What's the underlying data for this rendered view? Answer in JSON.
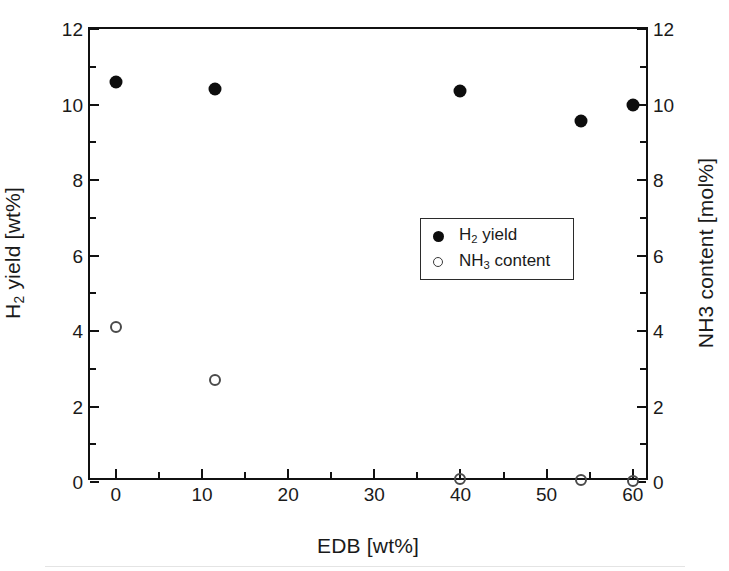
{
  "chart_data": {
    "type": "scatter",
    "title": "",
    "xlabel": "EDB [wt%]",
    "ylabel": "H2 yield [wt%]",
    "y2label": "NH3 content [mol%]",
    "xlim": [
      -3,
      62
    ],
    "ylim": [
      0,
      12
    ],
    "y2lim": [
      0,
      12
    ],
    "xticks": [
      0,
      10,
      20,
      30,
      40,
      50,
      60
    ],
    "xticklabels": [
      "0",
      "10",
      "20",
      "30",
      "40",
      "50",
      "60"
    ],
    "yticks": [
      0,
      2,
      4,
      6,
      8,
      10,
      12
    ],
    "yticklabels": [
      "0",
      "2",
      "4",
      "6",
      "8",
      "10",
      "12"
    ],
    "y2ticks": [
      0,
      2,
      4,
      6,
      8,
      10,
      12
    ],
    "y2ticklabels": [
      "0",
      "2",
      "4",
      "6",
      "8",
      "10",
      "12"
    ],
    "minor_ticks_y": [
      1,
      3,
      5,
      7,
      9,
      11
    ],
    "minor_ticks_x": [
      5,
      15,
      25,
      35,
      45,
      55
    ],
    "grid": false,
    "legend_position": "center-right",
    "series": [
      {
        "name": "H2 yield",
        "legend_label": "H₂ yield",
        "marker": "filled-circle",
        "color": "#0d0d0d",
        "axis": "left",
        "x": [
          0,
          11.5,
          40,
          54,
          60
        ],
        "values": [
          10.6,
          10.4,
          10.35,
          9.55,
          10.0
        ]
      },
      {
        "name": "NH3 content",
        "legend_label": "NH₃ content",
        "marker": "open-circle",
        "color": "#4a4a4a",
        "axis": "right",
        "x": [
          0,
          11.5,
          40,
          54,
          60
        ],
        "values": [
          4.1,
          2.7,
          0.08,
          0.05,
          0.03
        ]
      }
    ]
  },
  "axes": {
    "y_title_main": "H",
    "y_title_sub": "2",
    "y_title_rest": " yield [wt%]",
    "y2_title": "NH3 content [mol%]",
    "x_title": "EDB [wt%]"
  },
  "legend": {
    "items": [
      {
        "key": "filled-circle",
        "main": "H",
        "sub": "2",
        "rest": " yield"
      },
      {
        "key": "open-circle",
        "main": "NH",
        "sub": "3",
        "rest": " content"
      }
    ]
  }
}
